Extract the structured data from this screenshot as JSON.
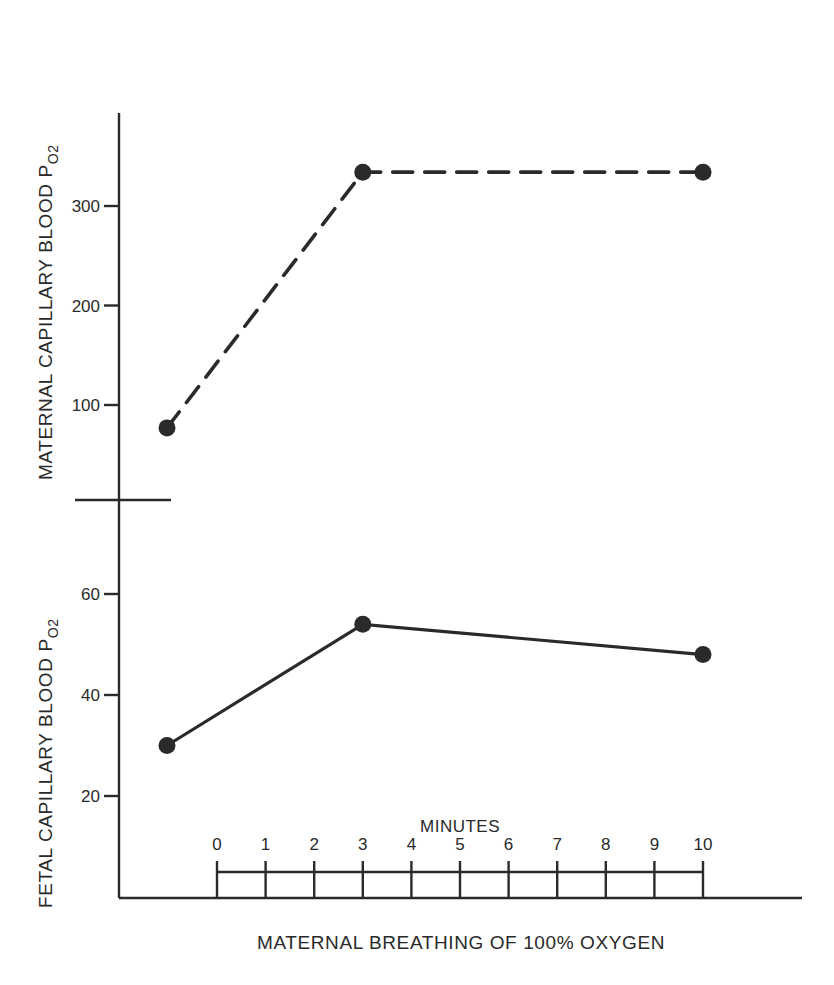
{
  "chart_data": {
    "type": "line",
    "title": "",
    "xlabel": "MATERNAL BREATHING OF 100% OXYGEN",
    "minutes_label": "MINUTES",
    "minutes_ticks": [
      "0",
      "1",
      "2",
      "3",
      "4",
      "5",
      "6",
      "7",
      "8",
      "9",
      "10"
    ],
    "x": [
      "baseline",
      "3",
      "10"
    ],
    "panels": [
      {
        "name": "maternal",
        "ylabel": "MATERNAL CAPILLARY BLOOD P",
        "ylabel_subscript": "O2",
        "yticks": [
          100,
          200,
          300
        ],
        "ylim": [
          75,
          370
        ],
        "series": [
          {
            "name": "Maternal capillary blood PO2",
            "style": "dashed",
            "x_minutes": [
              -1,
              3,
              10
            ],
            "values": [
              77,
              334,
              334
            ]
          }
        ]
      },
      {
        "name": "fetal",
        "ylabel": "FETAL CAPILLARY BLOOD  P",
        "ylabel_subscript": "O2",
        "yticks": [
          20,
          40,
          60
        ],
        "ylim": [
          0,
          80
        ],
        "series": [
          {
            "name": "Fetal capillary blood PO2",
            "style": "solid",
            "x_minutes": [
              -1,
              3,
              10
            ],
            "values": [
              30,
              54,
              48
            ]
          }
        ]
      }
    ],
    "grid": false,
    "legend": "none",
    "axis_break": true
  },
  "labels": {
    "maternal_ylabel": "MATERNAL CAPILLARY BLOOD P",
    "maternal_ylabel_sub": "O2",
    "fetal_ylabel": "FETAL CAPILLARY BLOOD  P",
    "fetal_ylabel_sub": "O2",
    "xlabel": "MATERNAL BREATHING OF 100% OXYGEN",
    "minutes": "MINUTES"
  }
}
